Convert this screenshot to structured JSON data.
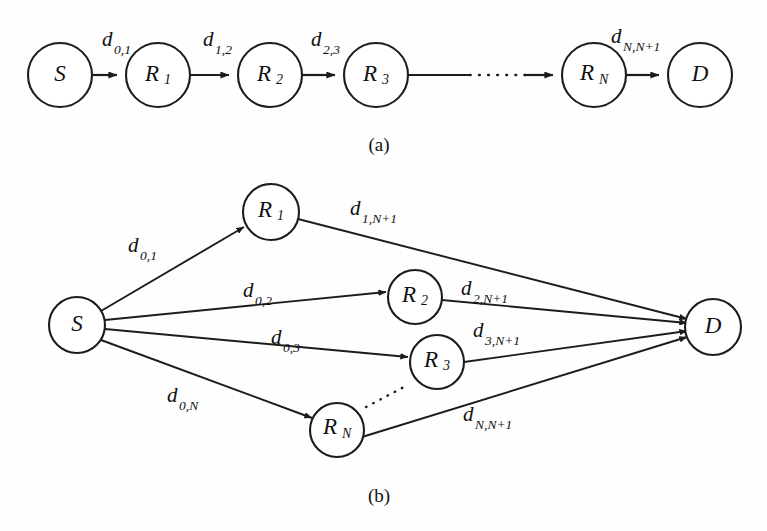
{
  "figure": {
    "background_color": "#fefefe",
    "ink_color": "#1c1c1c",
    "panels": [
      {
        "id": "panel-a",
        "caption": "(a)",
        "description": "serial multi-hop relay chain",
        "nodes": [
          {
            "id": "S",
            "label": "S",
            "sub": "",
            "cx": 60,
            "cy": 75,
            "r": 32
          },
          {
            "id": "R1",
            "label": "R",
            "sub": "1",
            "cx": 158,
            "cy": 75,
            "r": 32
          },
          {
            "id": "R2",
            "label": "R",
            "sub": "2",
            "cx": 270,
            "cy": 75,
            "r": 32
          },
          {
            "id": "R3",
            "label": "R",
            "sub": "3",
            "cx": 376,
            "cy": 75,
            "r": 32
          },
          {
            "id": "RN",
            "label": "R",
            "sub": "N",
            "cx": 594,
            "cy": 75,
            "r": 32
          },
          {
            "id": "D",
            "label": "D",
            "sub": "",
            "cx": 700,
            "cy": 75,
            "r": 32
          }
        ],
        "edges": [
          {
            "id": "S-R1",
            "from": "S",
            "to": "R1",
            "label": "d",
            "sub": "0,1",
            "style": "solid"
          },
          {
            "id": "R1-R2",
            "from": "R1",
            "to": "R2",
            "label": "d",
            "sub": "1,2",
            "style": "solid"
          },
          {
            "id": "R2-R3",
            "from": "R2",
            "to": "R3",
            "label": "d",
            "sub": "2,3",
            "style": "solid"
          },
          {
            "id": "R3-RN",
            "from": "R3",
            "to": "RN",
            "label": "",
            "sub": "",
            "style": "dotted-gap"
          },
          {
            "id": "RN-D",
            "from": "RN",
            "to": "D",
            "label": "d",
            "sub": "N,N+1",
            "style": "solid"
          }
        ]
      },
      {
        "id": "panel-b",
        "caption": "(b)",
        "description": "parallel two-hop relay network",
        "nodes": [
          {
            "id": "S",
            "label": "S",
            "sub": "",
            "cx": 77,
            "cy": 325,
            "r": 28
          },
          {
            "id": "R1",
            "label": "R",
            "sub": "1",
            "cx": 271,
            "cy": 212,
            "r": 28
          },
          {
            "id": "R2",
            "label": "R",
            "sub": "2",
            "cx": 415,
            "cy": 297,
            "r": 27
          },
          {
            "id": "R3",
            "label": "R",
            "sub": "3",
            "cx": 437,
            "cy": 362,
            "r": 27
          },
          {
            "id": "RN",
            "label": "R",
            "sub": "N",
            "cx": 337,
            "cy": 430,
            "r": 27
          },
          {
            "id": "D",
            "label": "D",
            "sub": "",
            "cx": 713,
            "cy": 327,
            "r": 28
          }
        ],
        "edges": [
          {
            "id": "S-R1",
            "from": "S",
            "to": "R1",
            "label": "d",
            "sub": "0,1",
            "style": "solid"
          },
          {
            "id": "S-R2",
            "from": "S",
            "to": "R2",
            "label": "d",
            "sub": "0,2",
            "style": "solid"
          },
          {
            "id": "S-R3",
            "from": "S",
            "to": "R3",
            "label": "d",
            "sub": "0,3",
            "style": "solid"
          },
          {
            "id": "S-RN",
            "from": "S",
            "to": "RN",
            "label": "d",
            "sub": "0,N",
            "style": "solid"
          },
          {
            "id": "R1-D",
            "from": "R1",
            "to": "D",
            "label": "d",
            "sub": "1,N+1",
            "style": "solid"
          },
          {
            "id": "R2-D",
            "from": "R2",
            "to": "D",
            "label": "d",
            "sub": "2,N+1",
            "style": "solid"
          },
          {
            "id": "R3-D",
            "from": "R3",
            "to": "D",
            "label": "d",
            "sub": "3,N+1",
            "style": "solid"
          },
          {
            "id": "RN-D",
            "from": "RN",
            "to": "D",
            "label": "d",
            "sub": "N,N+1",
            "style": "solid"
          }
        ],
        "ellipsis": {
          "from_x": 366,
          "from_y": 407,
          "to_x": 404,
          "to_y": 387
        }
      }
    ]
  }
}
